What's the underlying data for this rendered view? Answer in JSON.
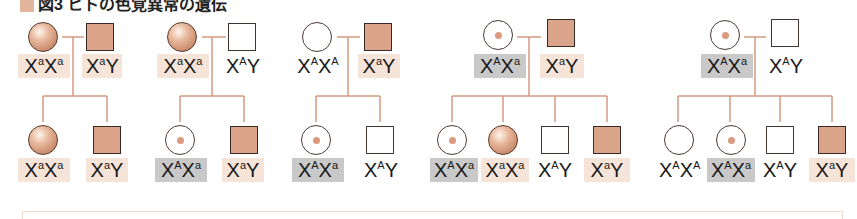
{
  "title": {
    "text": "図3 ヒトの色覚異常の遺伝",
    "swatch_color": "#e3b59c"
  },
  "colors": {
    "line": "#d39a80",
    "affected_fill": "#d9a48a",
    "carrier_dot": "#d99a80",
    "affected_label_bg": "#f6e4d8",
    "carrier_label_bg": "#c9c9c9"
  },
  "pedigrees": [
    {
      "parents": [
        {
          "sex": "female",
          "status": "affected",
          "genotype": {
            "a1": "a",
            "a2": "a",
            "base": "X",
            "second_base": "X"
          }
        },
        {
          "sex": "male",
          "status": "affected",
          "genotype": {
            "a1": "a",
            "base": "X",
            "second_base": "Y"
          }
        }
      ],
      "children": [
        {
          "sex": "female",
          "status": "affected",
          "genotype": {
            "a1": "a",
            "a2": "a"
          }
        },
        {
          "sex": "male",
          "status": "affected",
          "genotype": {
            "a1": "a"
          }
        }
      ]
    },
    {
      "parents": [
        {
          "sex": "female",
          "status": "affected",
          "genotype": {
            "a1": "a",
            "a2": "a"
          }
        },
        {
          "sex": "male",
          "status": "normal",
          "genotype": {
            "a1": "A"
          }
        }
      ],
      "children": [
        {
          "sex": "female",
          "status": "carrier",
          "genotype": {
            "a1": "A",
            "a2": "a"
          }
        },
        {
          "sex": "male",
          "status": "affected",
          "genotype": {
            "a1": "a"
          }
        }
      ]
    },
    {
      "parents": [
        {
          "sex": "female",
          "status": "normal",
          "genotype": {
            "a1": "A",
            "a2": "A"
          }
        },
        {
          "sex": "male",
          "status": "affected",
          "genotype": {
            "a1": "a"
          }
        }
      ],
      "children": [
        {
          "sex": "female",
          "status": "carrier",
          "genotype": {
            "a1": "A",
            "a2": "a"
          }
        },
        {
          "sex": "male",
          "status": "normal",
          "genotype": {
            "a1": "A"
          }
        }
      ]
    },
    {
      "parents": [
        {
          "sex": "female",
          "status": "carrier",
          "genotype": {
            "a1": "A",
            "a2": "a"
          }
        },
        {
          "sex": "male",
          "status": "affected",
          "genotype": {
            "a1": "a"
          }
        }
      ],
      "children": [
        {
          "sex": "female",
          "status": "carrier",
          "genotype": {
            "a1": "A",
            "a2": "a"
          }
        },
        {
          "sex": "female",
          "status": "affected",
          "genotype": {
            "a1": "a",
            "a2": "a"
          }
        },
        {
          "sex": "male",
          "status": "normal",
          "genotype": {
            "a1": "A"
          }
        },
        {
          "sex": "male",
          "status": "affected",
          "genotype": {
            "a1": "a"
          }
        }
      ]
    },
    {
      "parents": [
        {
          "sex": "female",
          "status": "carrier",
          "genotype": {
            "a1": "A",
            "a2": "a"
          }
        },
        {
          "sex": "male",
          "status": "normal",
          "genotype": {
            "a1": "A"
          }
        }
      ],
      "children": [
        {
          "sex": "female",
          "status": "normal",
          "genotype": {
            "a1": "A",
            "a2": "A"
          }
        },
        {
          "sex": "female",
          "status": "carrier",
          "genotype": {
            "a1": "A",
            "a2": "a"
          }
        },
        {
          "sex": "male",
          "status": "normal",
          "genotype": {
            "a1": "A"
          }
        },
        {
          "sex": "male",
          "status": "affected",
          "genotype": {
            "a1": "a"
          }
        }
      ]
    }
  ],
  "glyphs": {
    "x": "X",
    "y": "Y"
  }
}
